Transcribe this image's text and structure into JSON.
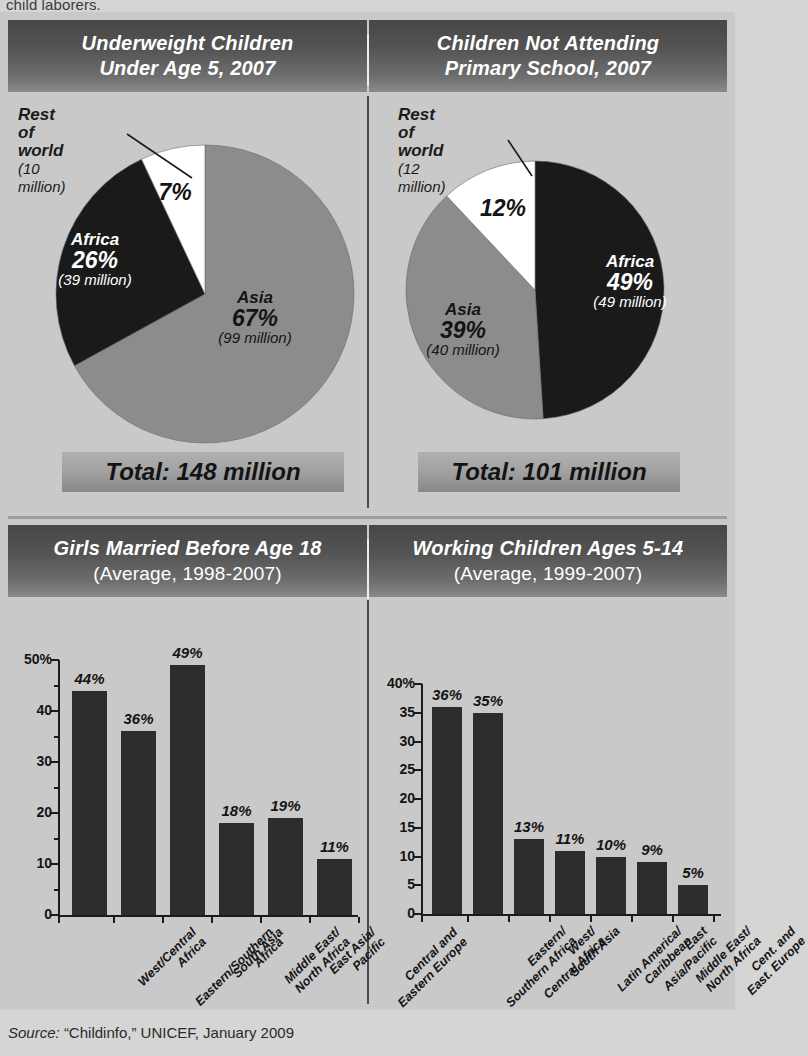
{
  "page": {
    "cut_off_text": "child laborers.",
    "source_prefix": "Source:",
    "source_text": "“Childinfo,”  UNICEF,  January 2009"
  },
  "colors": {
    "background": "#c9c9c9",
    "header_dark": "#474747",
    "header_light": "#8a8a8a",
    "bar_fill": "#2d2d2d",
    "pie_asia": "#8c8c8c",
    "pie_africa": "#1a1a1a",
    "pie_rest": "#ffffff",
    "text": "#141414"
  },
  "panels": {
    "pie_left": {
      "title_line1": "Underweight Children",
      "title_line2": "Under Age 5, 2007",
      "total_label": "Total: 148 million",
      "callout": {
        "name": "Rest of world",
        "sub": "(10 million)"
      }
    },
    "pie_right": {
      "title_line1": "Children Not Attending",
      "title_line2": "Primary School, 2007",
      "total_label": "Total: 101 million",
      "callout": {
        "name": "Rest of world",
        "sub": "(12 million)"
      }
    },
    "bar_left": {
      "title_line1": "Girls Married Before Age 18",
      "title_line2": "(Average, 1998-2007)"
    },
    "bar_right": {
      "title_line1": "Working Children Ages 5-14",
      "title_line2": "(Average, 1999-2007)"
    }
  },
  "chart_data": [
    {
      "type": "pie",
      "title": "Underweight Children Under Age 5, 2007",
      "total": "Total: 148 million",
      "total_value": 148,
      "unit": "million",
      "legend_position": "in-slice",
      "slices": [
        {
          "label": "Asia",
          "percent": 67,
          "pct_label": "67%",
          "value": 99,
          "value_label": "(99 million)",
          "color": "#8c8c8c",
          "text_color": "#141414"
        },
        {
          "label": "Africa",
          "percent": 26,
          "pct_label": "26%",
          "value": 39,
          "value_label": "(39 million)",
          "color": "#1a1a1a",
          "text_color": "#ffffff"
        },
        {
          "label": "Rest of world",
          "percent": 7,
          "pct_label": "7%",
          "value": 10,
          "value_label": "(10 million)",
          "color": "#ffffff",
          "text_color": "#141414"
        }
      ]
    },
    {
      "type": "pie",
      "title": "Children Not Attending Primary School, 2007",
      "total": "Total: 101 million",
      "total_value": 101,
      "unit": "million",
      "legend_position": "in-slice",
      "slices": [
        {
          "label": "Africa",
          "percent": 49,
          "pct_label": "49%",
          "value": 49,
          "value_label": "(49 million)",
          "color": "#1a1a1a",
          "text_color": "#ffffff"
        },
        {
          "label": "Asia",
          "percent": 39,
          "pct_label": "39%",
          "value": 40,
          "value_label": "(40 million)",
          "color": "#8c8c8c",
          "text_color": "#141414"
        },
        {
          "label": "Rest of world",
          "percent": 12,
          "pct_label": "12%",
          "value": 12,
          "value_label": "(12 million)",
          "color": "#ffffff",
          "text_color": "#141414"
        }
      ]
    },
    {
      "type": "bar",
      "title": "Girls Married Before Age 18",
      "subtitle": "(Average, 1998-2007)",
      "xlabel": "",
      "ylabel": "",
      "ylim": [
        0,
        50
      ],
      "grid": false,
      "ytick_labels": [
        "0",
        "10",
        "20",
        "30",
        "40",
        "50%"
      ],
      "ytick_values": [
        0,
        10,
        20,
        30,
        40,
        50
      ],
      "yminor_values": [
        5,
        15,
        25,
        35,
        45
      ],
      "categories": [
        "West/Central\nAfrica",
        "Eastern/Southern\nAfrica",
        "South Asia",
        "Middle East/\nNorth Africa",
        "East Asia/\nPacific",
        "Central and\nEastern Europe"
      ],
      "values": [
        44,
        36,
        49,
        18,
        19,
        11
      ],
      "value_labels": [
        "44%",
        "36%",
        "49%",
        "18%",
        "19%",
        "11%"
      ]
    },
    {
      "type": "bar",
      "title": "Working Children Ages 5-14",
      "subtitle": "(Average, 1999-2007)",
      "xlabel": "",
      "ylabel": "",
      "ylim": [
        0,
        40
      ],
      "grid": false,
      "ytick_labels": [
        "0",
        "5",
        "10",
        "15",
        "20",
        "25",
        "30",
        "35",
        "40%"
      ],
      "ytick_values": [
        0,
        5,
        10,
        15,
        20,
        25,
        30,
        35,
        40
      ],
      "yminor_values": [],
      "categories": [
        "Eastern/\nSouthern Africa",
        "West/\nCentral Africa",
        "South Asia",
        "Latin America/\nCaribbean",
        "East\nAsia/Pacific",
        "Middle East/\nNorth Africa",
        "Cent. and\nEast. Europe"
      ],
      "values": [
        36,
        35,
        13,
        11,
        10,
        9,
        5
      ],
      "value_labels": [
        "36%",
        "35%",
        "13%",
        "11%",
        "10%",
        "9%",
        "5%"
      ]
    }
  ]
}
